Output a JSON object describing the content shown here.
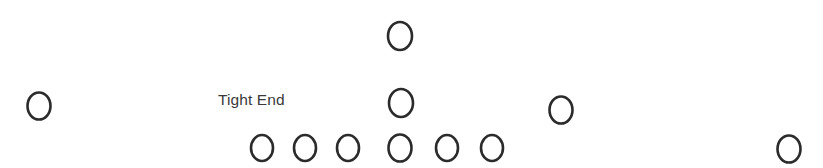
{
  "diagram": {
    "kind": "american-football-offensive-formation",
    "width": 823,
    "height": 168,
    "background_color": "#ffffff",
    "marker_stroke_color": "#2b2b2b",
    "label_text_color": "#3a3a3a"
  },
  "labels": [
    {
      "id": "tight-end-label",
      "text": "Tight End",
      "x": 218,
      "y": 92
    }
  ],
  "players": [
    {
      "id": "split-end",
      "role": "split end",
      "cx": 39,
      "cy": 106,
      "rx": 11.5,
      "ry": 13.5
    },
    {
      "id": "deep-back",
      "role": "deep back",
      "cx": 400,
      "cy": 36,
      "rx": 12.0,
      "ry": 14.0
    },
    {
      "id": "quarterback",
      "role": "quarterback",
      "cx": 401,
      "cy": 103,
      "rx": 12.0,
      "ry": 14.0
    },
    {
      "id": "flanker",
      "role": "flanker",
      "cx": 561,
      "cy": 110,
      "rx": 11.5,
      "ry": 13.5
    },
    {
      "id": "wide-receiver",
      "role": "wide receiver",
      "cx": 789,
      "cy": 149,
      "rx": 11.5,
      "ry": 13.5
    },
    {
      "id": "lineman-1",
      "role": "tight end",
      "cx": 262,
      "cy": 148,
      "rx": 11.0,
      "ry": 13.0
    },
    {
      "id": "lineman-2",
      "role": "left tackle",
      "cx": 305,
      "cy": 148,
      "rx": 11.0,
      "ry": 13.0
    },
    {
      "id": "lineman-3",
      "role": "left guard",
      "cx": 348,
      "cy": 148,
      "rx": 11.0,
      "ry": 13.0
    },
    {
      "id": "lineman-4",
      "role": "center",
      "cx": 400,
      "cy": 148,
      "rx": 11.5,
      "ry": 13.5
    },
    {
      "id": "lineman-5",
      "role": "right guard",
      "cx": 447,
      "cy": 148,
      "rx": 11.0,
      "ry": 13.0
    },
    {
      "id": "lineman-6",
      "role": "right tackle",
      "cx": 492,
      "cy": 148,
      "rx": 11.0,
      "ry": 13.0
    }
  ]
}
